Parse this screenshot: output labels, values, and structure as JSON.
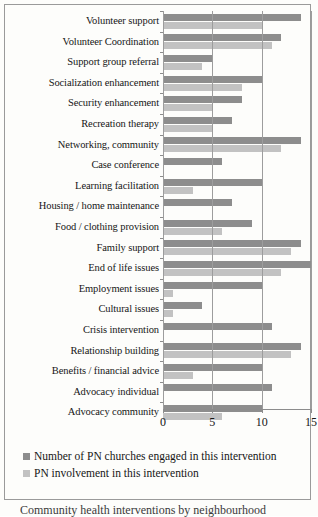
{
  "chart_data": {
    "type": "bar",
    "orientation": "horizontal",
    "title": "",
    "xlabel": "",
    "ylabel": "",
    "xlim": [
      0,
      15
    ],
    "xticks": [
      0,
      5,
      10,
      15
    ],
    "xtick_labels": [
      "0",
      "5",
      "10",
      "15"
    ],
    "grid": true,
    "legend_position": "bottom-left",
    "categories": [
      "Volunteer support",
      "Volunteer Coordination",
      "Support group referral",
      "Socialization enhancement",
      "Security enhancement",
      "Recreation therapy",
      "Networking, community",
      "Case conference",
      "Learning facilitation",
      "Housing / home maintenance",
      "Food / clothing provision",
      "Family support",
      "End of life issues",
      "Employment issues",
      "Cultural issues",
      "Crisis intervention",
      "Relationship building",
      "Benefits / financial advice",
      "Advocacy individual",
      "Advocacy community"
    ],
    "series": [
      {
        "name": "Number of PN churches engaged in this intervention",
        "color": "#8d8d8d",
        "values": [
          14,
          12,
          5,
          10,
          8,
          7,
          14,
          6,
          10,
          7,
          9,
          14,
          15,
          10,
          4,
          11,
          14,
          10,
          11,
          10
        ]
      },
      {
        "name": "PN involvement in this intervention",
        "color": "#c2c2c2",
        "values": [
          10,
          11,
          4,
          8,
          5,
          5,
          12,
          0,
          3,
          0,
          6,
          13,
          12,
          1,
          1,
          0,
          13,
          3,
          0,
          6
        ]
      }
    ]
  },
  "legend": {
    "items": [
      {
        "label": "Number of PN churches engaged in this intervention",
        "swatch": "dark"
      },
      {
        "label": "PN involvement in this intervention",
        "swatch": "light"
      }
    ]
  },
  "caption": {
    "text": "Community health interventions by neighbourhood"
  }
}
